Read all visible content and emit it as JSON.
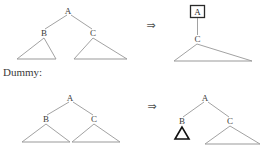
{
  "figure": {
    "caption_label": "Dummy:",
    "arrow_symbol": "⇒",
    "colors": {
      "background": "#ffffff",
      "edge": "#8a8a8a",
      "base": "#9a9a9a",
      "label": "#3b3b3b",
      "box": "#2a2a2a",
      "dummy": "#111111",
      "arrow": "#555555"
    }
  },
  "rows": [
    {
      "id": "row-top",
      "left_tree": {
        "id": "tree-top-left",
        "nodes": [
          {
            "id": "n-a",
            "label": "A",
            "x": 68,
            "y": 11
          },
          {
            "id": "n-b",
            "label": "B",
            "x": 44,
            "y": 33
          },
          {
            "id": "n-c",
            "label": "C",
            "x": 93,
            "y": 33
          }
        ],
        "edges": [
          {
            "from": "A",
            "to": "B"
          },
          {
            "from": "A",
            "to": "C"
          }
        ],
        "subtrees": [
          {
            "parent": "B",
            "apex_x": 44,
            "apex_y": 36,
            "left_x": 17,
            "right_x": 56,
            "base_y": 59
          },
          {
            "parent": "C",
            "apex_x": 93,
            "apex_y": 36,
            "left_x": 74,
            "right_x": 127,
            "base_y": 59
          }
        ]
      },
      "arrow": {
        "id": "arrow-top",
        "x": 151,
        "y": 26
      },
      "right_tree": {
        "id": "tree-top-right",
        "nodes": [
          {
            "id": "n-a-boxed",
            "label": "A",
            "x": 197,
            "y": 14,
            "boxed": true
          },
          {
            "id": "n-c",
            "label": "C",
            "x": 197,
            "y": 40
          }
        ],
        "edges": [
          {
            "from": "A",
            "to": "C"
          }
        ],
        "subtrees": [
          {
            "parent": "C",
            "apex_x": 197,
            "apex_y": 43,
            "left_x": 174,
            "right_x": 252,
            "base_y": 61
          }
        ],
        "box": {
          "x": 190,
          "y": 5,
          "w": 15,
          "h": 13
        }
      }
    },
    {
      "id": "row-bottom",
      "left_tree": {
        "id": "tree-bottom-left",
        "nodes": [
          {
            "id": "n-a",
            "label": "A",
            "x": 70,
            "y": 98
          },
          {
            "id": "n-b",
            "label": "B",
            "x": 46,
            "y": 119
          },
          {
            "id": "n-c",
            "label": "C",
            "x": 94,
            "y": 119
          }
        ],
        "edges": [
          {
            "from": "A",
            "to": "B"
          },
          {
            "from": "A",
            "to": "C"
          }
        ],
        "subtrees": [
          {
            "parent": "B",
            "apex_x": 46,
            "apex_y": 122,
            "left_x": 22,
            "right_x": 70,
            "base_y": 142
          },
          {
            "parent": "C",
            "apex_x": 94,
            "apex_y": 122,
            "left_x": 72,
            "right_x": 120,
            "base_y": 142
          }
        ]
      },
      "arrow": {
        "id": "arrow-bottom",
        "x": 152,
        "y": 107
      },
      "right_tree": {
        "id": "tree-bottom-right",
        "nodes": [
          {
            "id": "n-a",
            "label": "A",
            "x": 205,
            "y": 98
          },
          {
            "id": "n-b",
            "label": "B",
            "x": 182,
            "y": 121
          },
          {
            "id": "n-c",
            "label": "C",
            "x": 230,
            "y": 121
          }
        ],
        "edges": [
          {
            "from": "A",
            "to": "B"
          },
          {
            "from": "A",
            "to": "C"
          }
        ],
        "subtrees": [
          {
            "parent": "C",
            "apex_x": 230,
            "apex_y": 124,
            "left_x": 205,
            "right_x": 260,
            "base_y": 144
          }
        ],
        "dummy": {
          "apex_x": 182,
          "apex_y": 127,
          "left_x": 175,
          "right_x": 189,
          "base_y": 139
        }
      }
    }
  ]
}
